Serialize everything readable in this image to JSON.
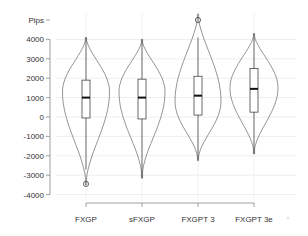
{
  "chart_data": {
    "type": "violin",
    "title": "",
    "xlabel": "",
    "ylabel": "Pips",
    "ylim": [
      -4000,
      4000
    ],
    "yticks": [
      -4000,
      -3000,
      -2000,
      -1000,
      0,
      1000,
      2000,
      3000,
      4000
    ],
    "grid": true,
    "legend": null,
    "categories": [
      "FXGP",
      "sFXGP",
      "FXGPT 3",
      "FXGPT 3e"
    ],
    "series": [
      {
        "name": "FXGP",
        "violin_max": 4100,
        "violin_min": -3500,
        "whisker_high": 4100,
        "q3": 1900,
        "median": 1000,
        "q1": -50,
        "whisker_low": -2700,
        "outliers": [
          -3450
        ],
        "max_width_at": 1300
      },
      {
        "name": "sFXGP",
        "violin_max": 4000,
        "violin_min": -3150,
        "whisker_high": 4000,
        "q3": 1950,
        "median": 1000,
        "q1": -100,
        "whisker_low": -3150,
        "outliers": [],
        "max_width_at": 1300
      },
      {
        "name": "FXGPT 3",
        "violin_max": 5300,
        "violin_min": -2250,
        "whisker_high": 4100,
        "q3": 2100,
        "median": 1100,
        "q1": 100,
        "whisker_low": -2200,
        "outliers": [
          5000
        ],
        "max_width_at": 800
      },
      {
        "name": "FXGPT 3e",
        "violin_max": 4300,
        "violin_min": -1900,
        "whisker_high": 4300,
        "q3": 2500,
        "median": 1450,
        "q1": 250,
        "whisker_low": -1900,
        "outliers": [],
        "max_width_at": 1500
      }
    ]
  }
}
